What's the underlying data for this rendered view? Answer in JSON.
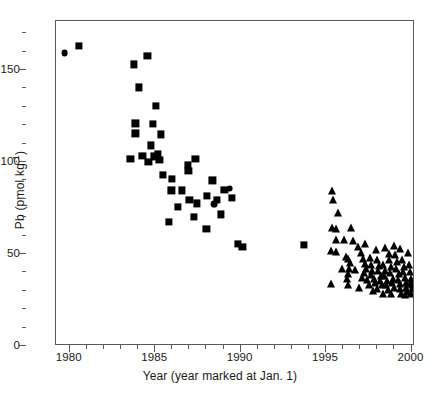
{
  "chart_data": {
    "type": "scatter",
    "title": "",
    "xlabel": "Year (year marked at Jan. 1)",
    "ylabel_html": "Pb (pmol kg<sup>-1</sup>)",
    "ylabel_text": "Pb (pmol kg-1)",
    "xlim": [
      1979.2,
      2000.2
    ],
    "ylim": [
      0,
      176.6
    ],
    "grid": false,
    "legend": "none",
    "x_major_ticks": [
      1980,
      1985,
      1990,
      1995,
      2000
    ],
    "x_major_tick_labels": [
      "1980",
      "1985",
      "1990",
      "1995",
      "2000"
    ],
    "x_minor_ticks": [
      1981,
      1982,
      1983,
      1984,
      1986,
      1987,
      1988,
      1989,
      1991,
      1992,
      1993,
      1994,
      1996,
      1997,
      1998,
      1999
    ],
    "y_major_ticks": [
      0,
      50,
      100,
      150
    ],
    "y_major_tick_labels": [
      "0",
      "50",
      "100",
      "150"
    ],
    "y_minor_ticks": [
      10,
      20,
      30,
      40,
      60,
      70,
      80,
      90,
      110,
      120,
      130,
      140,
      160,
      170
    ],
    "marker_color": "#000000",
    "frame_color": "#5a5a5a",
    "series": [
      {
        "name": "squares",
        "marker": "square",
        "size": 7.2,
        "points": [
          [
            1980.55,
            163.0
          ],
          [
            1983.75,
            153.0
          ],
          [
            1984.55,
            157.5
          ],
          [
            1984.05,
            140.5
          ],
          [
            1985.05,
            130.5
          ],
          [
            1983.85,
            121.0
          ],
          [
            1984.85,
            120.5
          ],
          [
            1983.85,
            115.5
          ],
          [
            1985.35,
            115.0
          ],
          [
            1984.75,
            109.0
          ],
          [
            1983.55,
            101.5
          ],
          [
            1984.25,
            103.5
          ],
          [
            1984.95,
            103.0
          ],
          [
            1985.15,
            104.5
          ],
          [
            1985.25,
            101.0
          ],
          [
            1984.6,
            100.0
          ],
          [
            1987.35,
            101.5
          ],
          [
            1986.9,
            98.5
          ],
          [
            1986.95,
            95.0
          ],
          [
            1985.45,
            93.0
          ],
          [
            1986.0,
            91.0
          ],
          [
            1988.35,
            90.0
          ],
          [
            1985.95,
            84.5
          ],
          [
            1986.55,
            84.5
          ],
          [
            1989.05,
            85.0
          ],
          [
            1988.05,
            81.5
          ],
          [
            1987.0,
            79.5
          ],
          [
            1986.35,
            75.5
          ],
          [
            1987.45,
            77.5
          ],
          [
            1989.5,
            80.5
          ],
          [
            1988.6,
            79.5
          ],
          [
            1985.8,
            67.5
          ],
          [
            1987.25,
            70.0
          ],
          [
            1988.85,
            71.5
          ],
          [
            1989.85,
            55.5
          ],
          [
            1990.1,
            54.0
          ],
          [
            1993.7,
            55.0
          ],
          [
            1988.0,
            63.5
          ]
        ]
      },
      {
        "name": "circles",
        "marker": "circle",
        "size": 6.8,
        "points": [
          [
            1979.7,
            159.0
          ],
          [
            1989.35,
            85.5
          ],
          [
            1988.45,
            77.0
          ]
        ]
      },
      {
        "name": "triangles",
        "marker": "triangle",
        "size": 9.2,
        "points": [
          [
            1995.35,
            84.0
          ],
          [
            1995.4,
            79.5
          ],
          [
            1995.7,
            72.0
          ],
          [
            1995.35,
            64.0
          ],
          [
            1995.55,
            63.5
          ],
          [
            1996.45,
            64.0
          ],
          [
            1995.55,
            57.5
          ],
          [
            1995.3,
            51.5
          ],
          [
            1995.55,
            51.0
          ],
          [
            1996.85,
            54.0
          ],
          [
            1996.15,
            48.5
          ],
          [
            1996.3,
            47.5
          ],
          [
            1996.4,
            45.0
          ],
          [
            1996.35,
            42.0
          ],
          [
            1996.3,
            39.0
          ],
          [
            1996.25,
            36.5
          ],
          [
            1995.3,
            33.5
          ],
          [
            1996.3,
            33.0
          ],
          [
            1997.05,
            50.5
          ],
          [
            1997.15,
            47.5
          ],
          [
            1997.25,
            44.5
          ],
          [
            1997.35,
            42.0
          ],
          [
            1997.2,
            39.5
          ],
          [
            1997.1,
            37.0
          ],
          [
            1997.4,
            36.0
          ],
          [
            1997.55,
            48.0
          ],
          [
            1997.65,
            44.0
          ],
          [
            1997.7,
            41.0
          ],
          [
            1997.6,
            38.5
          ],
          [
            1997.8,
            36.5
          ],
          [
            1997.85,
            34.0
          ],
          [
            1997.5,
            33.0
          ],
          [
            1998.0,
            46.5
          ],
          [
            1998.1,
            43.5
          ],
          [
            1998.05,
            40.5
          ],
          [
            1998.2,
            38.0
          ],
          [
            1998.15,
            35.5
          ],
          [
            1998.25,
            33.0
          ],
          [
            1998.0,
            31.0
          ],
          [
            1998.35,
            44.0
          ],
          [
            1998.45,
            41.0
          ],
          [
            1998.4,
            38.0
          ],
          [
            1998.55,
            35.5
          ],
          [
            1998.5,
            33.0
          ],
          [
            1998.6,
            30.5
          ],
          [
            1998.7,
            47.0
          ],
          [
            1998.8,
            43.0
          ],
          [
            1998.75,
            39.5
          ],
          [
            1998.9,
            36.5
          ],
          [
            1998.85,
            34.0
          ],
          [
            1998.95,
            31.5
          ],
          [
            1999.05,
            49.5
          ],
          [
            1999.15,
            45.5
          ],
          [
            1999.1,
            42.0
          ],
          [
            1999.25,
            39.0
          ],
          [
            1999.2,
            36.0
          ],
          [
            1999.3,
            33.5
          ],
          [
            1999.35,
            31.0
          ],
          [
            1999.45,
            47.0
          ],
          [
            1999.55,
            43.0
          ],
          [
            1999.5,
            40.0
          ],
          [
            1999.6,
            37.0
          ],
          [
            1999.65,
            34.0
          ],
          [
            1999.7,
            31.5
          ],
          [
            1999.75,
            29.5
          ],
          [
            1999.85,
            44.0
          ],
          [
            1999.9,
            40.0
          ],
          [
            1999.95,
            36.5
          ],
          [
            1999.88,
            33.5
          ],
          [
            2000.0,
            31.0
          ],
          [
            1999.98,
            28.5
          ],
          [
            1996.95,
            31.5
          ],
          [
            1997.75,
            30.0
          ],
          [
            1998.3,
            28.5
          ],
          [
            1999.4,
            28.0
          ],
          [
            1996.6,
            57.0
          ],
          [
            1997.9,
            52.0
          ],
          [
            1998.65,
            50.0
          ],
          [
            1999.0,
            54.5
          ],
          [
            1999.8,
            50.5
          ],
          [
            1996.05,
            57.5
          ],
          [
            1997.3,
            55.5
          ],
          [
            1998.45,
            53.0
          ],
          [
            1999.3,
            52.5
          ],
          [
            1995.95,
            42.0
          ],
          [
            1996.7,
            41.5
          ],
          [
            1998.8,
            28.5
          ],
          [
            1999.62,
            27.5
          ],
          [
            2000.05,
            33.0
          ]
        ]
      }
    ]
  }
}
